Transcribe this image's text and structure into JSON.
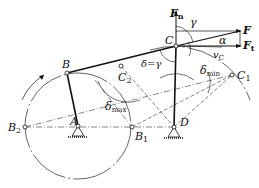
{
  "diagram": {
    "type": "four-bar linkage transmission angle diagram",
    "points": {
      "A": {
        "label": "A",
        "x": 78,
        "y": 126
      },
      "B": {
        "label": "B",
        "x": 67,
        "y": 73
      },
      "B1": {
        "label": "B",
        "sub": "1",
        "x": 132,
        "y": 127
      },
      "B2": {
        "label": "B",
        "sub": "2",
        "x": 25,
        "y": 127
      },
      "C": {
        "label": "C",
        "x": 176,
        "y": 46
      },
      "C1": {
        "label": "C",
        "sub": "1",
        "x": 232,
        "y": 75
      },
      "C2": {
        "label": "C",
        "sub": "2",
        "x": 121,
        "y": 66
      },
      "D": {
        "label": "D",
        "x": 174,
        "y": 127
      }
    },
    "labels": {
      "force": "F",
      "force_normal": "F",
      "force_normal_sub": "n",
      "force_tangent": "F",
      "force_tangent_sub": "t",
      "gamma": "γ",
      "alpha": "α",
      "velocity": "v",
      "velocity_sub": "C",
      "delta_eq_gamma": "δ=γ",
      "delta_min": "δ",
      "delta_min_sub": "min",
      "delta_max": "δ",
      "delta_max_sub": "max"
    },
    "colors": {
      "line": "#111111",
      "dash": "#333333"
    }
  }
}
